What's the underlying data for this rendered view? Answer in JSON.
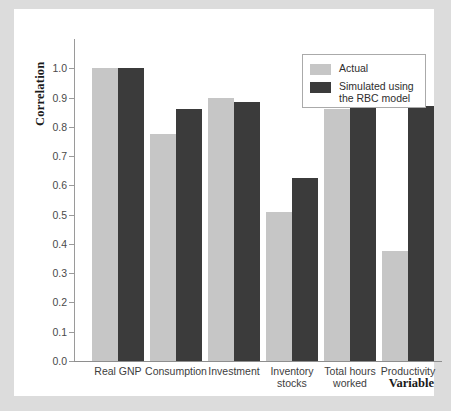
{
  "chart_data": {
    "type": "bar",
    "title": "",
    "xlabel": "Variable",
    "ylabel": "Correlation",
    "ylim": [
      0.0,
      1.1
    ],
    "grid": false,
    "legend_position": "top-right",
    "categories": [
      "Real GNP",
      "Consumption",
      "Investment",
      "Inventory\nstocks",
      "Total hours\nworked",
      "Productivity"
    ],
    "ytick_labels": [
      "0.0",
      "0.1",
      "0.2",
      "0.3",
      "0.4",
      "0.5",
      "0.6",
      "0.7",
      "0.8",
      "0.9",
      "1.0"
    ],
    "ytick_values": [
      0.0,
      0.1,
      0.2,
      0.3,
      0.4,
      0.5,
      0.6,
      0.7,
      0.8,
      0.9,
      1.0
    ],
    "series": [
      {
        "name": "Actual",
        "color": "#c6c6c6",
        "values": [
          1.0,
          0.775,
          0.9,
          0.51,
          0.86,
          0.375
        ]
      },
      {
        "name": "Simulated using\nthe RBC model",
        "color": "#3b3b3b",
        "values": [
          1.0,
          0.86,
          0.885,
          0.625,
          0.955,
          0.87
        ]
      }
    ]
  },
  "legend": {
    "entries": [
      {
        "label": "Actual",
        "color": "#c6c6c6"
      },
      {
        "label": "Simulated using\nthe RBC model",
        "color": "#3b3b3b"
      }
    ]
  },
  "axes": {
    "y_title": "Correlation",
    "x_title": "Variable"
  },
  "colors": {
    "actual": "#c6c6c6",
    "simulated": "#3b3b3b",
    "axis": "#9a9a9a",
    "page_background": "#dcdcdc",
    "paper": "#ffffff"
  }
}
